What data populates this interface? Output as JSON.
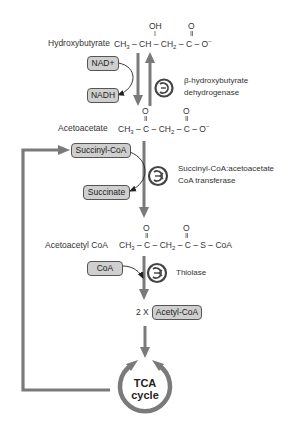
{
  "diagram": {
    "molecules": {
      "hydroxybutyrate": {
        "name": "Hydroxybutyrate",
        "structure": [
          "CH3",
          "CH",
          "CH2",
          "C",
          "O-"
        ],
        "substituents": {
          "oh": "OH",
          "o": "O"
        }
      },
      "acetoacetate": {
        "name": "Acetoacetate",
        "structure": [
          "CH3",
          "C",
          "CH2",
          "C",
          "O-"
        ],
        "substituents": {
          "o1": "O",
          "o2": "O"
        }
      },
      "acetoacetyl_coa": {
        "name": "Acetoacetyl CoA",
        "structure": [
          "CH3",
          "C",
          "CH2",
          "C",
          "S",
          "CoA"
        ],
        "substituents": {
          "o1": "O",
          "o2": "O"
        }
      }
    },
    "cofactors": {
      "nad": "NAD+",
      "nadh": "NADH",
      "succinyl_coa": "Succinyl-CoA",
      "succinate": "Succinate",
      "coa": "CoA",
      "acetyl_coa": "Acetyl-CoA",
      "multiplier": "2 X"
    },
    "enzymes": {
      "e1_line1": "β-hydroxybutyrate",
      "e1_line2": "dehydrogenase",
      "e2_line1": "Succinyl-CoA:acetoacetate",
      "e2_line2": "CoA transferase",
      "e3": "Thiolase"
    },
    "tca": {
      "line1": "TCA",
      "line2": "cycle"
    },
    "colors": {
      "arrow": "#7a7a7a",
      "box_fill": "#cfcfcf",
      "box_border": "#555555",
      "text": "#333333"
    }
  }
}
